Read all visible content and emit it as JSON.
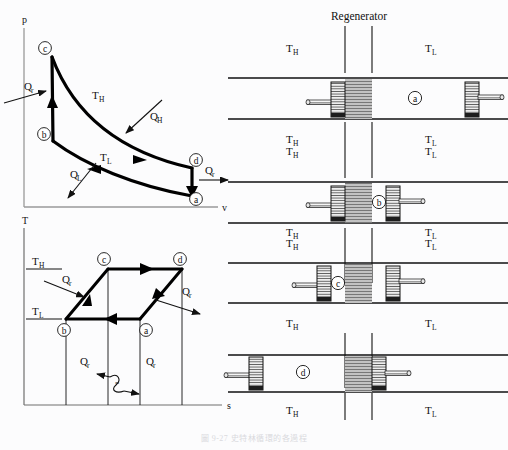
{
  "figure": {
    "title_caption": "圖 9-27 史特林循環的各過程",
    "background": "#fcfcfd",
    "ink": "#111111",
    "thick_curve": "#000000",
    "regen_fill": "#b9b9b9",
    "piston_fill": "#d8d8d8"
  },
  "pv_diagram": {
    "name": "p-v diagram",
    "y_axis_label": "p",
    "x_axis_label": "v",
    "state_points": [
      {
        "id": "a",
        "label": "a",
        "x": 196,
        "y": 199
      },
      {
        "id": "b",
        "label": "b",
        "x": 46,
        "y": 134
      },
      {
        "id": "c",
        "label": "c",
        "x": 47,
        "y": 50
      },
      {
        "id": "d",
        "label": "d",
        "x": 196,
        "y": 160
      }
    ],
    "process_labels": [
      {
        "label": "T",
        "sub": "H",
        "x": 97,
        "y": 97
      },
      {
        "label": "T",
        "sub": "L",
        "x": 104,
        "y": 159
      },
      {
        "label": "Q",
        "sub": "H",
        "x": 152,
        "y": 116
      },
      {
        "label": "Q",
        "sub": "L",
        "x": 76,
        "y": 176
      },
      {
        "label": "Q",
        "sub": "r",
        "x": 30,
        "y": 88
      },
      {
        "label": "Q",
        "sub": "r",
        "x": 211,
        "y": 173
      }
    ]
  },
  "ts_diagram": {
    "name": "T-s diagram",
    "y_axis_label": "T",
    "x_axis_label": "s",
    "temperature_levels": [
      {
        "label": "T",
        "sub": "H",
        "x": 28,
        "y": 263
      },
      {
        "label": "T",
        "sub": "L",
        "x": 28,
        "y": 313
      }
    ],
    "state_points": [
      {
        "id": "a",
        "label": "a",
        "x": 144,
        "y": 330
      },
      {
        "id": "b",
        "label": "b",
        "x": 64,
        "y": 330
      },
      {
        "id": "c",
        "label": "c",
        "x": 102,
        "y": 264
      },
      {
        "id": "d",
        "label": "d",
        "x": 178,
        "y": 264
      }
    ],
    "heat_labels": [
      {
        "label": "Q",
        "sub": "r",
        "x": 68,
        "y": 282
      },
      {
        "label": "Q",
        "sub": "r",
        "x": 185,
        "y": 294
      },
      {
        "label": "Q",
        "sub": "r",
        "x": 86,
        "y": 363
      },
      {
        "label": "Q",
        "sub": "r",
        "x": 152,
        "y": 363
      }
    ]
  },
  "regenerator_panel": {
    "title": "Regenerator",
    "temp_hot": "T",
    "temp_hot_sub": "H",
    "temp_cold": "T",
    "temp_cold_sub": "L",
    "stages": [
      {
        "id": "a",
        "label": "a",
        "description": "both pistons at outer-left / far-right; gas in cold side",
        "left_piston_x": 100,
        "right_piston_x": 243,
        "gas_label_x": 185
      },
      {
        "id": "b",
        "label": "b",
        "description": "both pistons compressed toward regenerator; gas in cold side",
        "left_piston_x": 100,
        "right_piston_x": 168,
        "gas_label_x": 190
      },
      {
        "id": "c",
        "label": "c",
        "description": "pistons around regenerator; gas in hot side",
        "left_piston_x": 68,
        "right_piston_x": 168,
        "gas_label_x": 100
      },
      {
        "id": "d",
        "label": "d",
        "description": "left piston at far left; gas expanded in hot side",
        "left_piston_x": 12,
        "right_piston_x": 168,
        "gas_label_x": 78
      }
    ]
  }
}
